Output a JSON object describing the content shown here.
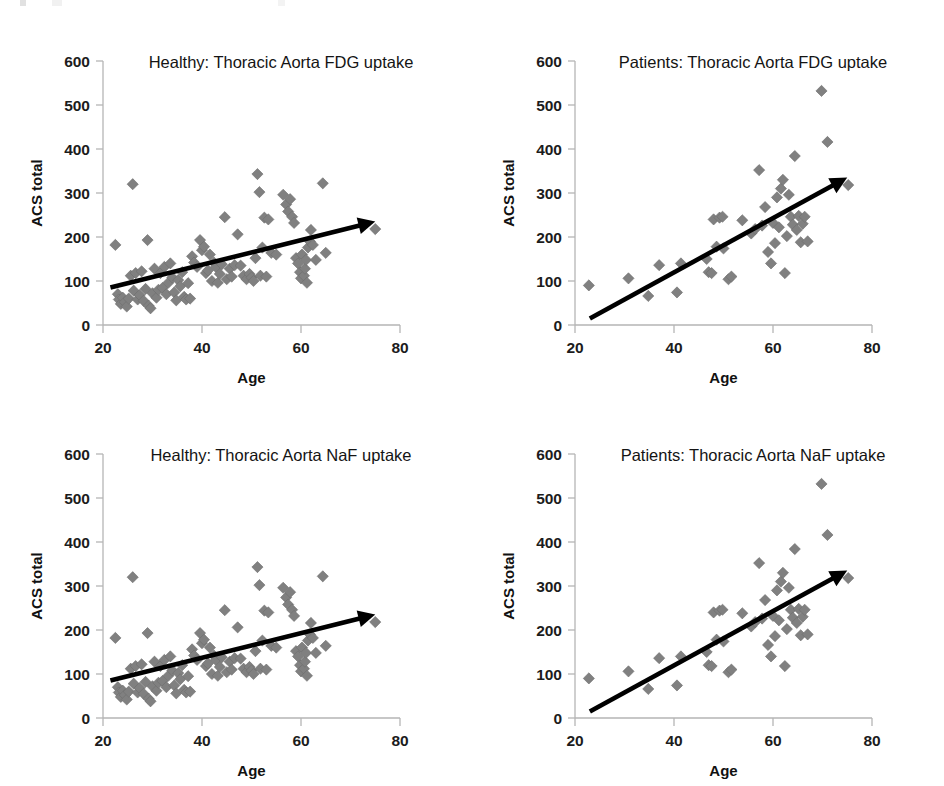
{
  "figure": {
    "background_color": "#ffffff",
    "marker_color": "#808080",
    "axis_color": "#b5b5b5",
    "trend_color": "#000000",
    "panel_count": 4
  },
  "panels": [
    {
      "id": "healthy-fdg",
      "position": "top-left",
      "title": "Healthy: Thoracic Aorta FDG uptake"
    },
    {
      "id": "patients-fdg",
      "position": "top-right",
      "title": "Patients: Thoracic Aorta FDG uptake"
    },
    {
      "id": "healthy-naf",
      "position": "bottom-left",
      "title": "Healthy: Thoracic Aorta NaF uptake"
    },
    {
      "id": "patients-naf",
      "position": "bottom-right",
      "title": "Patients: Thoracic Aorta NaF uptake"
    }
  ],
  "axes": {
    "xlabel": "Age",
    "ylabel": "ACS total",
    "xticks": [
      "20",
      "40",
      "60",
      "80"
    ],
    "yticks": [
      "0",
      "100",
      "200",
      "300",
      "400",
      "500",
      "600"
    ],
    "xlim": [
      20,
      80
    ],
    "ylim": [
      0,
      600
    ]
  },
  "chart_data": [
    {
      "type": "scatter",
      "id": "healthy-fdg",
      "title": "Healthy: Thoracic Aorta FDG uptake",
      "xlabel": "Age",
      "ylabel": "ACS total",
      "xlim": [
        20,
        80
      ],
      "ylim": [
        0,
        600
      ],
      "xticks": [
        20,
        40,
        60,
        80
      ],
      "yticks": [
        0,
        100,
        200,
        300,
        400,
        500,
        600
      ],
      "grid": false,
      "legend": "none",
      "marker": "diamond",
      "marker_color": "#808080",
      "trendline": {
        "type": "arrow",
        "color": "#000000",
        "x_start": 21.5,
        "y_start": 85,
        "x_end": 75.0,
        "y_end": 235
      },
      "points": [
        [
          22.5,
          182
        ],
        [
          23.0,
          70
        ],
        [
          23.2,
          58
        ],
        [
          23.6,
          48
        ],
        [
          24.0,
          62
        ],
        [
          24.4,
          52
        ],
        [
          24.8,
          42
        ],
        [
          25.2,
          60
        ],
        [
          25.6,
          112
        ],
        [
          26.0,
          320
        ],
        [
          26.2,
          78
        ],
        [
          26.6,
          118
        ],
        [
          27.0,
          58
        ],
        [
          27.4,
          68
        ],
        [
          27.8,
          122
        ],
        [
          28.2,
          55
        ],
        [
          28.6,
          82
        ],
        [
          29.0,
          193
        ],
        [
          29.2,
          44
        ],
        [
          29.6,
          38
        ],
        [
          30.0,
          72
        ],
        [
          30.4,
          128
        ],
        [
          30.8,
          62
        ],
        [
          31.2,
          80
        ],
        [
          31.6,
          118
        ],
        [
          32.0,
          84
        ],
        [
          32.4,
          132
        ],
        [
          32.8,
          70
        ],
        [
          33.2,
          96
        ],
        [
          33.6,
          140
        ],
        [
          34.0,
          108
        ],
        [
          34.4,
          74
        ],
        [
          34.8,
          56
        ],
        [
          35.2,
          102
        ],
        [
          35.6,
          88
        ],
        [
          36.0,
          120
        ],
        [
          36.4,
          64
        ],
        [
          36.8,
          58
        ],
        [
          37.2,
          95
        ],
        [
          37.6,
          60
        ],
        [
          38.0,
          156
        ],
        [
          38.4,
          142
        ],
        [
          39.0,
          132
        ],
        [
          39.6,
          193
        ],
        [
          40.0,
          170
        ],
        [
          40.4,
          178
        ],
        [
          40.8,
          118
        ],
        [
          41.2,
          124
        ],
        [
          41.6,
          160
        ],
        [
          42.0,
          100
        ],
        [
          42.4,
          142
        ],
        [
          42.8,
          132
        ],
        [
          43.2,
          96
        ],
        [
          43.6,
          116
        ],
        [
          44.0,
          138
        ],
        [
          44.6,
          245
        ],
        [
          45.0,
          104
        ],
        [
          45.6,
          128
        ],
        [
          46.0,
          110
        ],
        [
          46.6,
          136
        ],
        [
          47.2,
          206
        ],
        [
          47.8,
          135
        ],
        [
          48.4,
          112
        ],
        [
          49.0,
          104
        ],
        [
          49.6,
          116
        ],
        [
          50.0,
          108
        ],
        [
          50.4,
          100
        ],
        [
          50.8,
          152
        ],
        [
          51.2,
          343
        ],
        [
          51.6,
          302
        ],
        [
          51.8,
          112
        ],
        [
          52.2,
          176
        ],
        [
          52.6,
          244
        ],
        [
          53.0,
          110
        ],
        [
          53.4,
          240
        ],
        [
          54.0,
          164
        ],
        [
          55.0,
          160
        ],
        [
          56.4,
          296
        ],
        [
          57.0,
          274
        ],
        [
          57.4,
          258
        ],
        [
          57.8,
          286
        ],
        [
          58.2,
          246
        ],
        [
          58.6,
          232
        ],
        [
          59.0,
          152
        ],
        [
          59.4,
          140
        ],
        [
          59.8,
          120
        ],
        [
          60.0,
          106
        ],
        [
          60.2,
          160
        ],
        [
          60.6,
          112
        ],
        [
          60.8,
          128
        ],
        [
          61.0,
          148
        ],
        [
          61.2,
          96
        ],
        [
          61.4,
          176
        ],
        [
          61.8,
          190
        ],
        [
          62.0,
          216
        ],
        [
          62.4,
          182
        ],
        [
          63.0,
          148
        ],
        [
          64.4,
          322
        ],
        [
          65.0,
          164
        ],
        [
          75.0,
          218
        ]
      ]
    },
    {
      "type": "scatter",
      "id": "patients-fdg",
      "title": "Patients: Thoracic Aorta FDG uptake",
      "xlabel": "Age",
      "ylabel": "ACS total",
      "xlim": [
        20,
        80
      ],
      "ylim": [
        0,
        600
      ],
      "xticks": [
        20,
        40,
        60,
        80
      ],
      "yticks": [
        0,
        100,
        200,
        300,
        400,
        500,
        600
      ],
      "grid": false,
      "legend": "none",
      "marker": "diamond",
      "marker_color": "#808080",
      "trendline": {
        "type": "arrow",
        "color": "#000000",
        "x_start": 23.0,
        "y_start": 15,
        "x_end": 75.0,
        "y_end": 335
      },
      "points": [
        [
          22.8,
          90
        ],
        [
          30.8,
          106
        ],
        [
          34.8,
          66
        ],
        [
          37.0,
          136
        ],
        [
          40.6,
          74
        ],
        [
          41.4,
          140
        ],
        [
          46.6,
          150
        ],
        [
          47.0,
          120
        ],
        [
          47.6,
          118
        ],
        [
          48.0,
          240
        ],
        [
          48.6,
          178
        ],
        [
          49.2,
          244
        ],
        [
          49.8,
          246
        ],
        [
          50.0,
          174
        ],
        [
          51.0,
          104
        ],
        [
          51.6,
          110
        ],
        [
          53.8,
          238
        ],
        [
          55.6,
          208
        ],
        [
          56.4,
          218
        ],
        [
          57.2,
          352
        ],
        [
          57.8,
          226
        ],
        [
          58.4,
          268
        ],
        [
          59.0,
          166
        ],
        [
          59.6,
          140
        ],
        [
          60.0,
          232
        ],
        [
          60.4,
          186
        ],
        [
          60.8,
          290
        ],
        [
          61.2,
          222
        ],
        [
          61.6,
          310
        ],
        [
          62.0,
          330
        ],
        [
          62.4,
          118
        ],
        [
          62.8,
          202
        ],
        [
          63.2,
          296
        ],
        [
          63.6,
          246
        ],
        [
          64.0,
          228
        ],
        [
          64.4,
          384
        ],
        [
          64.8,
          216
        ],
        [
          65.2,
          248
        ],
        [
          65.6,
          188
        ],
        [
          66.0,
          230
        ],
        [
          66.4,
          246
        ],
        [
          67.0,
          190
        ],
        [
          69.8,
          532
        ],
        [
          71.0,
          416
        ],
        [
          75.2,
          318
        ]
      ]
    },
    {
      "type": "scatter",
      "id": "healthy-naf",
      "title": "Healthy: Thoracic Aorta NaF uptake",
      "xlabel": "Age",
      "ylabel": "ACS total",
      "xlim": [
        20,
        80
      ],
      "ylim": [
        0,
        600
      ],
      "xticks": [
        20,
        40,
        60,
        80
      ],
      "yticks": [
        0,
        100,
        200,
        300,
        400,
        500,
        600
      ],
      "grid": false,
      "legend": "none",
      "marker": "diamond",
      "marker_color": "#808080",
      "trendline": {
        "type": "arrow",
        "color": "#000000",
        "x_start": 21.5,
        "y_start": 85,
        "x_end": 75.0,
        "y_end": 235
      },
      "points": [
        [
          22.5,
          182
        ],
        [
          23.0,
          70
        ],
        [
          23.2,
          58
        ],
        [
          23.6,
          48
        ],
        [
          24.0,
          62
        ],
        [
          24.4,
          52
        ],
        [
          24.8,
          42
        ],
        [
          25.2,
          60
        ],
        [
          25.6,
          112
        ],
        [
          26.0,
          320
        ],
        [
          26.2,
          78
        ],
        [
          26.6,
          118
        ],
        [
          27.0,
          58
        ],
        [
          27.4,
          68
        ],
        [
          27.8,
          122
        ],
        [
          28.2,
          55
        ],
        [
          28.6,
          82
        ],
        [
          29.0,
          193
        ],
        [
          29.2,
          44
        ],
        [
          29.6,
          38
        ],
        [
          30.0,
          72
        ],
        [
          30.4,
          128
        ],
        [
          30.8,
          62
        ],
        [
          31.2,
          80
        ],
        [
          31.6,
          118
        ],
        [
          32.0,
          84
        ],
        [
          32.4,
          132
        ],
        [
          32.8,
          70
        ],
        [
          33.2,
          96
        ],
        [
          33.6,
          140
        ],
        [
          34.0,
          108
        ],
        [
          34.4,
          74
        ],
        [
          34.8,
          56
        ],
        [
          35.2,
          102
        ],
        [
          35.6,
          88
        ],
        [
          36.0,
          120
        ],
        [
          36.4,
          64
        ],
        [
          36.8,
          58
        ],
        [
          37.2,
          95
        ],
        [
          37.6,
          60
        ],
        [
          38.0,
          156
        ],
        [
          38.4,
          142
        ],
        [
          39.0,
          132
        ],
        [
          39.6,
          193
        ],
        [
          40.0,
          170
        ],
        [
          40.4,
          178
        ],
        [
          40.8,
          118
        ],
        [
          41.2,
          124
        ],
        [
          41.6,
          160
        ],
        [
          42.0,
          100
        ],
        [
          42.4,
          142
        ],
        [
          42.8,
          132
        ],
        [
          43.2,
          96
        ],
        [
          43.6,
          116
        ],
        [
          44.0,
          138
        ],
        [
          44.6,
          245
        ],
        [
          45.0,
          104
        ],
        [
          45.6,
          128
        ],
        [
          46.0,
          110
        ],
        [
          46.6,
          136
        ],
        [
          47.2,
          206
        ],
        [
          47.8,
          135
        ],
        [
          48.4,
          112
        ],
        [
          49.0,
          104
        ],
        [
          49.6,
          116
        ],
        [
          50.0,
          108
        ],
        [
          50.4,
          100
        ],
        [
          50.8,
          152
        ],
        [
          51.2,
          343
        ],
        [
          51.6,
          302
        ],
        [
          51.8,
          112
        ],
        [
          52.2,
          176
        ],
        [
          52.6,
          244
        ],
        [
          53.0,
          110
        ],
        [
          53.4,
          240
        ],
        [
          54.0,
          164
        ],
        [
          55.0,
          160
        ],
        [
          56.4,
          296
        ],
        [
          57.0,
          274
        ],
        [
          57.4,
          258
        ],
        [
          57.8,
          286
        ],
        [
          58.2,
          246
        ],
        [
          58.6,
          232
        ],
        [
          59.0,
          152
        ],
        [
          59.4,
          140
        ],
        [
          59.8,
          120
        ],
        [
          60.0,
          106
        ],
        [
          60.2,
          160
        ],
        [
          60.6,
          112
        ],
        [
          60.8,
          128
        ],
        [
          61.0,
          148
        ],
        [
          61.2,
          96
        ],
        [
          61.4,
          176
        ],
        [
          61.8,
          190
        ],
        [
          62.0,
          216
        ],
        [
          62.4,
          182
        ],
        [
          63.0,
          148
        ],
        [
          64.4,
          322
        ],
        [
          65.0,
          164
        ],
        [
          75.0,
          218
        ]
      ]
    },
    {
      "type": "scatter",
      "id": "patients-naf",
      "title": "Patients: Thoracic Aorta NaF uptake",
      "xlabel": "Age",
      "ylabel": "ACS total",
      "xlim": [
        20,
        80
      ],
      "ylim": [
        0,
        600
      ],
      "xticks": [
        20,
        40,
        60,
        80
      ],
      "yticks": [
        0,
        100,
        200,
        300,
        400,
        500,
        600
      ],
      "grid": false,
      "legend": "none",
      "marker": "diamond",
      "marker_color": "#808080",
      "trendline": {
        "type": "arrow",
        "color": "#000000",
        "x_start": 23.0,
        "y_start": 15,
        "x_end": 75.0,
        "y_end": 335
      },
      "points": [
        [
          22.8,
          90
        ],
        [
          30.8,
          106
        ],
        [
          34.8,
          66
        ],
        [
          37.0,
          136
        ],
        [
          40.6,
          74
        ],
        [
          41.4,
          140
        ],
        [
          46.6,
          150
        ],
        [
          47.0,
          120
        ],
        [
          47.6,
          118
        ],
        [
          48.0,
          240
        ],
        [
          48.6,
          178
        ],
        [
          49.2,
          244
        ],
        [
          49.8,
          246
        ],
        [
          50.0,
          174
        ],
        [
          51.0,
          104
        ],
        [
          51.6,
          110
        ],
        [
          53.8,
          238
        ],
        [
          55.6,
          208
        ],
        [
          56.4,
          218
        ],
        [
          57.2,
          352
        ],
        [
          57.8,
          226
        ],
        [
          58.4,
          268
        ],
        [
          59.0,
          166
        ],
        [
          59.6,
          140
        ],
        [
          60.0,
          232
        ],
        [
          60.4,
          186
        ],
        [
          60.8,
          290
        ],
        [
          61.2,
          222
        ],
        [
          61.6,
          310
        ],
        [
          62.0,
          330
        ],
        [
          62.4,
          118
        ],
        [
          62.8,
          202
        ],
        [
          63.2,
          296
        ],
        [
          63.6,
          246
        ],
        [
          64.0,
          228
        ],
        [
          64.4,
          384
        ],
        [
          64.8,
          216
        ],
        [
          65.2,
          248
        ],
        [
          65.6,
          188
        ],
        [
          66.0,
          230
        ],
        [
          66.4,
          246
        ],
        [
          67.0,
          190
        ],
        [
          69.8,
          532
        ],
        [
          71.0,
          416
        ],
        [
          75.2,
          318
        ]
      ]
    }
  ]
}
